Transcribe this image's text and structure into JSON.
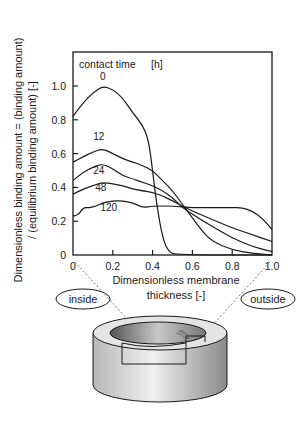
{
  "chart_data": {
    "type": "line",
    "title": "",
    "legend_title": "contact time",
    "legend_unit": "[h]",
    "xlabel_line1": "Dimensionless membrane",
    "xlabel_line2": "thickness [-]",
    "ylabel_line1": "Dimensionless binding amount = (binding amount)",
    "ylabel_line2": "/ (equilibrium binding amount) [-]",
    "xlim": [
      0,
      1.0
    ],
    "ylim": [
      0,
      1.0
    ],
    "xticks": [
      "0",
      "0.2",
      "0.4",
      "0.6",
      "0.8",
      "1.0"
    ],
    "yticks": [
      "0",
      "0.2",
      "0.4",
      "0.6",
      "0.8",
      "1.0"
    ],
    "grid": false,
    "series": [
      {
        "name": "0",
        "label": "0",
        "x": [
          0,
          0.05,
          0.1,
          0.15,
          0.2,
          0.25,
          0.3,
          0.35,
          0.38,
          0.4,
          0.42,
          0.45,
          0.48,
          0.52,
          1.0
        ],
        "y": [
          0.82,
          0.9,
          0.96,
          1.0,
          0.98,
          0.93,
          0.84,
          0.77,
          0.68,
          0.5,
          0.3,
          0.1,
          0.02,
          0.0,
          0.0
        ]
      },
      {
        "name": "12",
        "label": "12",
        "x": [
          0,
          0.05,
          0.1,
          0.15,
          0.2,
          0.25,
          0.3,
          0.35,
          0.4,
          0.45,
          0.5,
          0.55,
          0.6,
          0.65,
          0.7,
          0.8,
          0.9,
          1.0
        ],
        "y": [
          0.55,
          0.58,
          0.61,
          0.63,
          0.6,
          0.57,
          0.55,
          0.53,
          0.5,
          0.44,
          0.38,
          0.3,
          0.22,
          0.14,
          0.08,
          0.03,
          0.01,
          0.0
        ]
      },
      {
        "name": "24",
        "label": "24",
        "x": [
          0,
          0.05,
          0.1,
          0.15,
          0.2,
          0.25,
          0.3,
          0.35,
          0.4,
          0.45,
          0.5,
          0.55,
          0.6,
          0.7,
          0.8,
          0.9,
          1.0
        ],
        "y": [
          0.44,
          0.49,
          0.52,
          0.54,
          0.51,
          0.47,
          0.45,
          0.43,
          0.41,
          0.38,
          0.34,
          0.28,
          0.24,
          0.17,
          0.1,
          0.05,
          0.02
        ]
      },
      {
        "name": "48",
        "label": "48",
        "x": [
          0,
          0.05,
          0.1,
          0.15,
          0.2,
          0.25,
          0.3,
          0.35,
          0.4,
          0.45,
          0.5,
          0.55,
          0.6,
          0.7,
          0.8,
          0.9,
          1.0
        ],
        "y": [
          0.36,
          0.39,
          0.41,
          0.43,
          0.42,
          0.41,
          0.39,
          0.38,
          0.37,
          0.35,
          0.32,
          0.29,
          0.26,
          0.21,
          0.16,
          0.12,
          0.08
        ]
      },
      {
        "name": "120",
        "label": "120",
        "x": [
          0,
          0.03,
          0.05,
          0.08,
          0.12,
          0.15,
          0.2,
          0.25,
          0.3,
          0.35,
          0.4,
          0.5,
          0.6,
          0.7,
          0.8,
          0.85,
          0.9,
          0.95,
          1.0
        ],
        "y": [
          0.23,
          0.24,
          0.28,
          0.28,
          0.29,
          0.31,
          0.32,
          0.32,
          0.31,
          0.28,
          0.29,
          0.29,
          0.28,
          0.28,
          0.28,
          0.28,
          0.26,
          0.22,
          0.15
        ]
      }
    ],
    "annotations": [
      "inside",
      "outside"
    ]
  },
  "labels": {
    "inside": "inside",
    "outside": "outside"
  },
  "colors": {
    "ink": "#1a1a1a",
    "background": "#ffffff"
  }
}
